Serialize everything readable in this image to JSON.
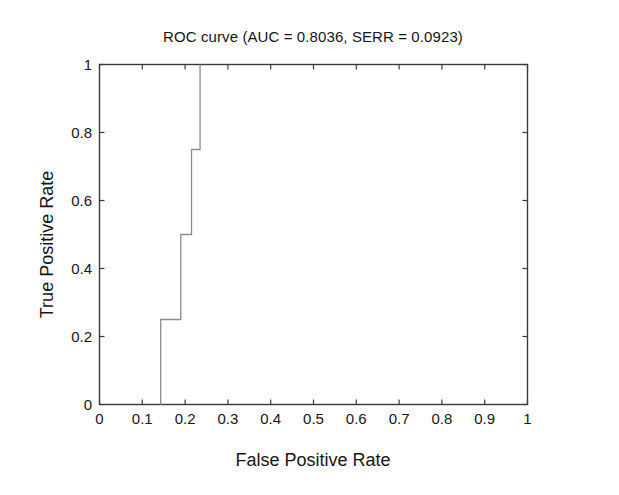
{
  "chart_data": {
    "type": "line",
    "title": "ROC curve (AUC = 0.8036, SERR = 0.0923)",
    "xlabel": "False Positive Rate",
    "ylabel": "True Positive Rate",
    "xlim": [
      0,
      1
    ],
    "ylim": [
      0,
      1
    ],
    "grid": false,
    "legend": "none",
    "line_style": "step",
    "line_color": "#8c8c8c",
    "series": [
      {
        "name": "ROC curve",
        "x": [
          0.143,
          0.143,
          0.19,
          0.19,
          0.215,
          0.215,
          0.235,
          0.235
        ],
        "y": [
          0,
          0.25,
          0.25,
          0.5,
          0.5,
          0.75,
          0.75,
          1
        ]
      }
    ],
    "xticks": [
      0,
      0.1,
      0.2,
      0.3,
      0.4,
      0.5,
      0.6,
      0.7,
      0.8,
      0.9,
      1
    ],
    "yticks": [
      0,
      0.2,
      0.4,
      0.6,
      0.8,
      1
    ],
    "xtick_labels": [
      "0",
      "0.1",
      "0.2",
      "0.3",
      "0.4",
      "0.5",
      "0.6",
      "0.7",
      "0.8",
      "0.9",
      "1"
    ],
    "ytick_labels": [
      "0",
      "0.2",
      "0.4",
      "0.6",
      "0.8",
      "1"
    ],
    "annotations": {
      "auc": "0.8036",
      "serr": "0.0923"
    }
  },
  "figure": {
    "background_color": "#ffffff",
    "axis_color": "#3a3a3a"
  }
}
